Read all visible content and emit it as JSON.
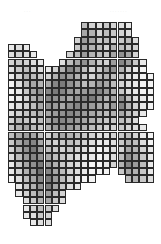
{
  "header": {
    "left_caption": "· · ·",
    "right_caption": "· · · · · · ·"
  },
  "mosaic": {
    "origin_x": 8,
    "origin_y": 22,
    "cell_size": 7.3,
    "columns": 20,
    "line_color": "#2a2a2a",
    "rows": [
      {
        "start": 10,
        "values": [
          30,
          20,
          15,
          25,
          20,
          15,
          10
        ]
      },
      {
        "start": 10,
        "values": [
          40,
          35,
          20,
          30,
          25,
          20,
          15
        ]
      },
      {
        "start": 9,
        "values": [
          20,
          45,
          40,
          25,
          30,
          20,
          25,
          30,
          15
        ]
      },
      {
        "start": 0,
        "values": [
          10,
          15,
          10
        ],
        "start2": 9,
        "values2": [
          25,
          40,
          35,
          30,
          20,
          35,
          30,
          25,
          20
        ]
      },
      {
        "start": 0,
        "values": [
          15,
          20,
          15,
          10
        ],
        "start2": 8,
        "values2": [
          20,
          30,
          45,
          35,
          30,
          25,
          40,
          50,
          40,
          20
        ]
      },
      {
        "start": 0,
        "values": [
          20,
          25,
          20,
          15,
          10
        ],
        "start2": 7,
        "values2": [
          15,
          30,
          40,
          50,
          35,
          25,
          20,
          45,
          55,
          45,
          25,
          10
        ]
      },
      {
        "start": 0,
        "values": [
          15,
          25,
          30,
          20,
          15,
          10,
          20,
          35,
          55,
          45,
          30,
          20,
          25,
          40,
          50,
          35,
          20,
          10,
          5
        ]
      },
      {
        "start": 0,
        "values": [
          10,
          20,
          35,
          30,
          25,
          20,
          35,
          50,
          45,
          35,
          25,
          20,
          30,
          35,
          30,
          25,
          15,
          10,
          5,
          5
        ]
      },
      {
        "start": 0,
        "values": [
          5,
          15,
          30,
          40,
          35,
          40,
          55,
          60,
          50,
          40,
          30,
          35,
          45,
          40,
          30,
          20,
          15,
          10,
          5,
          5
        ]
      },
      {
        "start": 0,
        "values": [
          5,
          10,
          25,
          40,
          50,
          55,
          60,
          55,
          45,
          40,
          45,
          50,
          55,
          45,
          35,
          25,
          15,
          10,
          5,
          5
        ]
      },
      {
        "start": 0,
        "values": [
          5,
          10,
          20,
          35,
          45,
          55,
          50,
          45,
          40,
          50,
          55,
          60,
          45,
          35,
          40,
          50,
          30,
          15,
          10,
          5
        ]
      },
      {
        "start": 0,
        "values": [
          10,
          15,
          20,
          30,
          40,
          50,
          45,
          40,
          50,
          55,
          50,
          45,
          40,
          35,
          45,
          55,
          35,
          20,
          10,
          5
        ]
      },
      {
        "start": 0,
        "values": [
          15,
          20,
          25,
          30,
          35,
          40,
          45,
          50,
          55,
          50,
          45,
          40,
          35,
          30,
          35,
          40,
          30,
          20,
          10
        ]
      },
      {
        "start": 0,
        "values": [
          20,
          30,
          25,
          20,
          30,
          40,
          50,
          55,
          50,
          45,
          40,
          35,
          30,
          25,
          25,
          30,
          25,
          15
        ]
      },
      {
        "start": 0,
        "values": [
          25,
          35,
          40,
          30,
          25,
          35,
          45,
          50,
          45,
          40,
          35,
          30,
          25,
          20,
          20,
          25,
          20,
          15,
          10
        ]
      },
      {
        "start": 0,
        "values": [
          30,
          40,
          45,
          40,
          30,
          20,
          30,
          40,
          35,
          30,
          25,
          20,
          15,
          15,
          20,
          25,
          30,
          20,
          10,
          5
        ]
      },
      {
        "start": 0,
        "values": [
          25,
          40,
          50,
          55,
          40,
          25,
          20,
          25,
          30,
          25,
          20,
          15,
          10,
          10,
          15,
          25,
          35,
          30,
          15,
          5
        ]
      },
      {
        "start": 0,
        "values": [
          20,
          35,
          50,
          60,
          45,
          30,
          25,
          20,
          25,
          20,
          15,
          10,
          5,
          10,
          15,
          20,
          40,
          35,
          20,
          10
        ]
      },
      {
        "start": 0,
        "values": [
          15,
          30,
          45,
          55,
          50,
          40,
          30,
          25,
          20,
          15,
          10,
          10,
          5,
          10,
          15,
          30,
          50,
          40,
          25,
          10
        ]
      },
      {
        "start": 0,
        "values": [
          10,
          25,
          40,
          50,
          60,
          45,
          35,
          25,
          20,
          15,
          10,
          5,
          5,
          10,
          20,
          35,
          55,
          45,
          30,
          10
        ]
      },
      {
        "start": 0,
        "values": [
          10,
          20,
          35,
          45,
          65,
          55,
          40,
          30,
          20,
          15,
          10,
          5,
          5,
          5
        ],
        "start2": 15,
        "values2": [
          25,
          40,
          35,
          25,
          10
        ]
      },
      {
        "start": 0,
        "values": [
          5,
          15,
          30,
          40,
          55,
          60,
          45,
          30,
          20,
          10,
          5,
          5
        ],
        "start2": 16,
        "values2": [
          30,
          35,
          25,
          15
        ]
      },
      {
        "start": 1,
        "values": [
          10,
          25,
          35,
          50,
          60,
          40,
          25,
          15,
          10
        ]
      },
      {
        "start": 1,
        "values": [
          10,
          20,
          30,
          40,
          45,
          30,
          20
        ]
      },
      {
        "start": 2,
        "values": [
          15,
          25,
          35,
          40,
          25,
          15
        ]
      },
      {
        "start": 2,
        "values": [
          10,
          20,
          30,
          25,
          15
        ]
      },
      {
        "start": 2,
        "values": [
          10,
          15,
          25,
          20
        ]
      },
      {
        "start": 3,
        "values": [
          10,
          15,
          15
        ]
      }
    ]
  }
}
